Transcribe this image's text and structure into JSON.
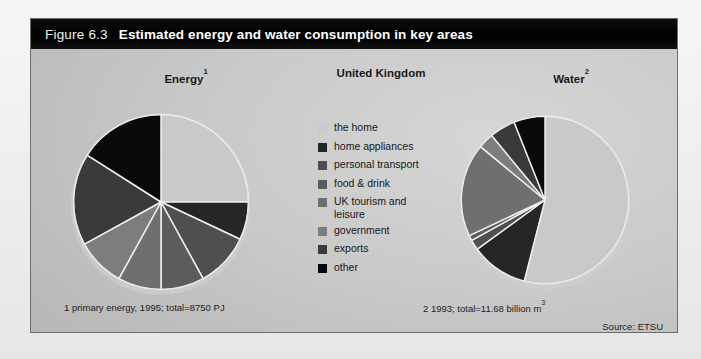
{
  "figure": {
    "number_label": "Figure 6.3",
    "title": "Estimated energy and water consumption in key areas",
    "region_title": "United Kingdom",
    "source": "Source: ETSU"
  },
  "legend": {
    "items": [
      {
        "label": "the home",
        "color": "#c9c9c9",
        "key": "the-home"
      },
      {
        "label": "home appliances",
        "color": "#262626",
        "key": "home-appliances"
      },
      {
        "label": "personal transport",
        "color": "#4f4f4f",
        "key": "personal-transport"
      },
      {
        "label": "food & drink",
        "color": "#5c5c5c",
        "key": "food-drink"
      },
      {
        "label": "UK tourism and\nleisure",
        "color": "#6f6f6f",
        "key": "uk-tourism-leisure"
      },
      {
        "label": "government",
        "color": "#7d7d7d",
        "key": "government"
      },
      {
        "label": "exports",
        "color": "#3a3a3a",
        "key": "exports"
      },
      {
        "label": "other",
        "color": "#0a0a0a",
        "key": "other"
      }
    ]
  },
  "charts": {
    "energy": {
      "title": "Energy",
      "title_superscript": "1",
      "footnote": "1 primary energy, 1995; total=8750 PJ"
    },
    "water": {
      "title": "Water",
      "title_superscript": "2",
      "footnote_prefix": "2 1993; total=11.68 billion m",
      "footnote_superscript": "3"
    }
  },
  "chart_data": [
    {
      "type": "pie",
      "id": "energy",
      "title": "Energy",
      "unit": "percent of primary energy",
      "total_label": "total=8750 PJ",
      "year": 1995,
      "categories": [
        "the home",
        "home appliances",
        "personal transport",
        "food & drink",
        "UK tourism and leisure",
        "government",
        "exports",
        "other"
      ],
      "values": [
        25,
        7,
        10,
        8,
        8,
        9,
        17,
        16
      ],
      "colors": [
        "#c9c9c9",
        "#262626",
        "#4f4f4f",
        "#5c5c5c",
        "#6f6f6f",
        "#7d7d7d",
        "#3a3a3a",
        "#0a0a0a"
      ],
      "start_angle_deg": 0,
      "direction": "clockwise",
      "legend_position": "center"
    },
    {
      "type": "pie",
      "id": "water",
      "title": "Water",
      "unit": "percent of water consumption",
      "total_label": "total=11.68 billion m3",
      "year": 1993,
      "categories": [
        "the home",
        "home appliances",
        "personal transport",
        "food & drink",
        "UK tourism and leisure",
        "government",
        "exports",
        "other"
      ],
      "values": [
        54,
        11,
        2,
        1,
        18,
        3,
        5,
        6
      ],
      "colors": [
        "#c9c9c9",
        "#262626",
        "#4f4f4f",
        "#5c5c5c",
        "#6f6f6f",
        "#7d7d7d",
        "#3a3a3a",
        "#0a0a0a"
      ],
      "start_angle_deg": 0,
      "direction": "clockwise",
      "legend_position": "center"
    }
  ]
}
